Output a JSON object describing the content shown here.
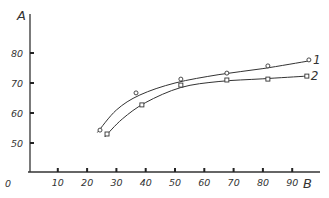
{
  "chart_data": {
    "type": "line",
    "title": "",
    "xlabel": "B",
    "ylabel": "A",
    "xlim": [
      0,
      98
    ],
    "ylim": [
      40,
      86
    ],
    "grid": false,
    "legend": "inline labels at right end of curves",
    "x_ticks": [
      0,
      10,
      20,
      30,
      40,
      50,
      60,
      70,
      80,
      90
    ],
    "y_ticks": [
      50,
      60,
      70,
      80
    ],
    "origin_label": "0",
    "series": [
      {
        "name": "1",
        "marker": "circle",
        "x": [
          24.4,
          36.7,
          52,
          67.7,
          81.7,
          95.7
        ],
        "y": [
          54.3,
          66.7,
          71.3,
          73.3,
          75.7,
          77.7
        ]
      },
      {
        "name": "2",
        "marker": "square",
        "x": [
          26.8,
          38.7,
          52,
          67.7,
          81.7,
          95
        ],
        "y": [
          53,
          62.7,
          69.3,
          71,
          71.3,
          72.3
        ]
      }
    ]
  }
}
